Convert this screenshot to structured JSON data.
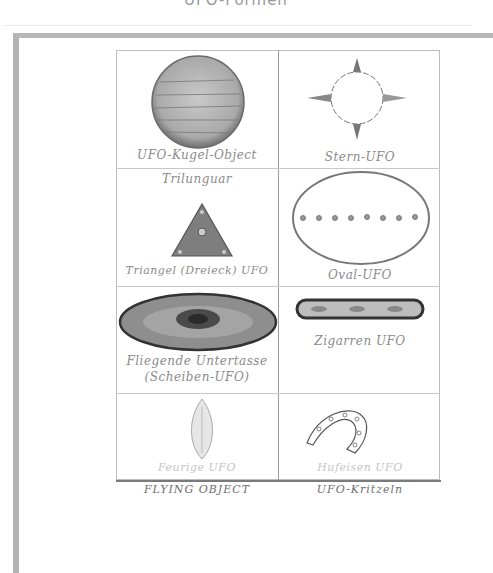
{
  "page": {
    "title": "UFO-Formen"
  },
  "drawing": {
    "cells": [
      {
        "id": "kugel",
        "label": "UFO-Kugel-Object",
        "shape": "sphere"
      },
      {
        "id": "stern",
        "label": "Stern-UFO",
        "shape": "star"
      },
      {
        "id": "triangel",
        "label_top": "Trilunguar",
        "label": "Triangel (Dreieck) UFO",
        "shape": "triangle"
      },
      {
        "id": "oval",
        "label": "Oval-UFO",
        "shape": "oval"
      },
      {
        "id": "scheiben",
        "label": "Fliegende Untertasse",
        "label2": "(Scheiben-UFO)",
        "shape": "saucer"
      },
      {
        "id": "zigarre",
        "label": "Zigarren UFO",
        "shape": "cigar"
      },
      {
        "id": "feuer",
        "label": "Feurige UFO",
        "shape": "flame"
      },
      {
        "id": "hufeisen",
        "label": "Hufeisen UFO",
        "shape": "horseshoe"
      }
    ],
    "footer": {
      "left": "FLYING OBJECT",
      "right": "UFO-Kritzeln"
    }
  },
  "colors": {
    "frame_border": "#b4b4b4",
    "pencil_dark": "#3a3a3a",
    "pencil_mid": "#8a8a8a",
    "paper": "#ffffff"
  }
}
